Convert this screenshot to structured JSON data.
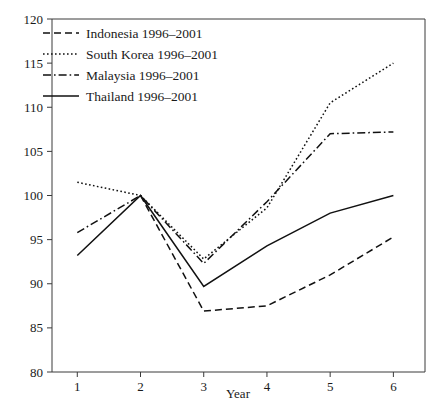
{
  "chart_data": {
    "type": "line",
    "title": "",
    "subtitle": "",
    "xlabel": "Year",
    "ylabel": "",
    "x": [
      1,
      2,
      3,
      4,
      5,
      6
    ],
    "xtick_labels": [
      "1",
      "2",
      "3",
      "4",
      "5",
      "6"
    ],
    "ytick_labels": [
      "80",
      "85",
      "90",
      "95",
      "100",
      "105",
      "110",
      "115",
      "120"
    ],
    "yticks": [
      80,
      85,
      90,
      95,
      100,
      105,
      110,
      115,
      120
    ],
    "xlim": [
      0.6,
      6.5
    ],
    "ylim": [
      80,
      120
    ],
    "grid": false,
    "legend_position": "top-left",
    "series": [
      {
        "name": "Indonesia 1996–2001",
        "style": "dashed",
        "values": [
          null,
          100.0,
          86.9,
          87.5,
          91.0,
          95.3
        ]
      },
      {
        "name": "South Korea 1996–2001",
        "style": "dotted",
        "values": [
          101.5,
          100.0,
          92.8,
          98.6,
          110.5,
          115.0
        ]
      },
      {
        "name": "Malaysia 1996–2001",
        "style": "dash-dot",
        "values": [
          95.8,
          100.0,
          92.3,
          99.3,
          107.0,
          107.2
        ]
      },
      {
        "name": "Thailand 1996–2001",
        "style": "solid",
        "values": [
          93.2,
          100.0,
          89.7,
          94.3,
          98.0,
          100.0
        ]
      }
    ]
  },
  "legend": {
    "entries": [
      {
        "label": "Indonesia 1996–2001"
      },
      {
        "label": "South Korea 1996–2001"
      },
      {
        "label": "Malaysia 1996–2001"
      },
      {
        "label": "Thailand 1996–2001"
      }
    ]
  },
  "colors": {
    "line": "#111111",
    "axis": "#3a3a3a",
    "background": "#ffffff"
  }
}
